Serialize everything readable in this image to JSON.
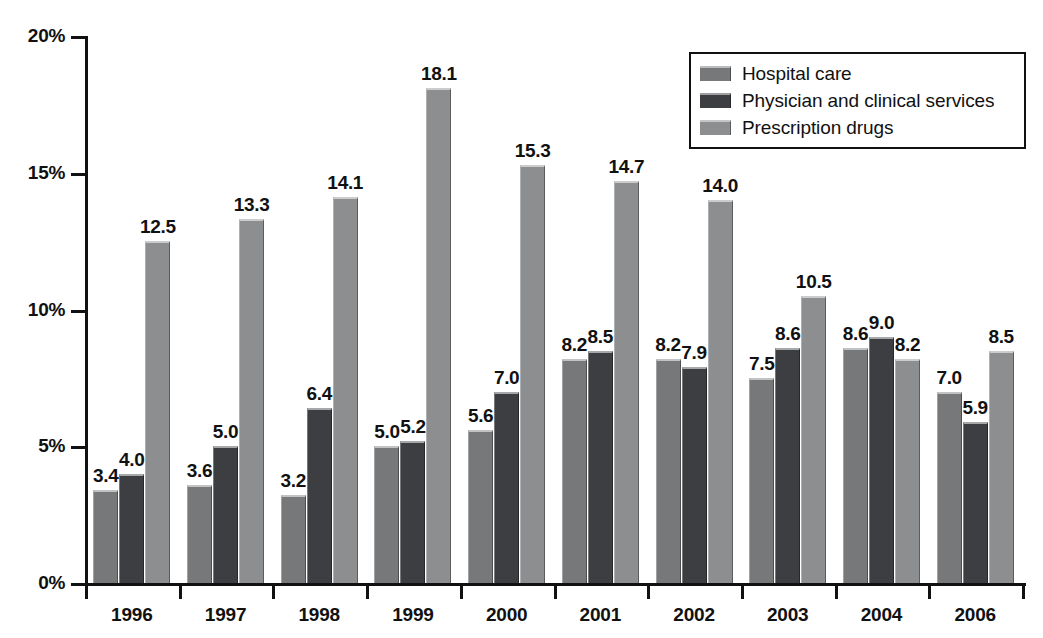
{
  "chart_data": {
    "type": "bar",
    "title": "",
    "subtitle": "",
    "xlabel": "",
    "ylabel": "",
    "grid": false,
    "legend_position": "top-right",
    "ylim": [
      0,
      20
    ],
    "y_ticks": [
      0,
      5,
      10,
      15,
      20
    ],
    "y_tick_labels": [
      "0%",
      "5%",
      "10%",
      "15%",
      "20%"
    ],
    "categories": [
      "1996",
      "1997",
      "1998",
      "1999",
      "2000",
      "2001",
      "2002",
      "2003",
      "2004",
      "2006"
    ],
    "series": [
      {
        "name": "Hospital care",
        "color": "#77787a",
        "values": [
          3.4,
          3.6,
          3.2,
          5.0,
          5.6,
          8.2,
          8.2,
          7.5,
          8.6,
          7.0
        ],
        "labels": [
          "3.4",
          "3.6",
          "3.2",
          "5.0",
          "5.6",
          "8.2",
          "8.2",
          "7.5",
          "8.6",
          "7.0"
        ]
      },
      {
        "name": "Physician and clinical services",
        "color": "#3d3e41",
        "values": [
          4.0,
          5.0,
          6.4,
          5.2,
          7.0,
          8.5,
          7.9,
          8.6,
          9.0,
          5.9
        ],
        "labels": [
          "4.0",
          "5.0",
          "6.4",
          "5.2",
          "7.0",
          "8.5",
          "7.9",
          "8.6",
          "9.0",
          "5.9"
        ]
      },
      {
        "name": "Prescription drugs",
        "color": "#8d8e90",
        "values": [
          12.5,
          13.3,
          14.1,
          18.1,
          15.3,
          14.7,
          14.0,
          10.5,
          8.2,
          8.5
        ],
        "labels": [
          "12.5",
          "13.3",
          "14.1",
          "18.1",
          "15.3",
          "14.7",
          "14.0",
          "10.5",
          "8.2",
          "8.5"
        ]
      }
    ]
  },
  "legend": {
    "items": [
      {
        "label": "Hospital care",
        "color": "#77787a"
      },
      {
        "label": "Physician and clinical services",
        "color": "#3d3e41"
      },
      {
        "label": "Prescription drugs",
        "color": "#8d8e90"
      }
    ]
  },
  "axes": {
    "y_tick_labels": [
      "20%",
      "15%",
      "10%",
      "5%",
      "0%"
    ],
    "x_tick_labels": [
      "1996",
      "1997",
      "1998",
      "1999",
      "2000",
      "2001",
      "2002",
      "2003",
      "2004",
      "2006"
    ]
  }
}
